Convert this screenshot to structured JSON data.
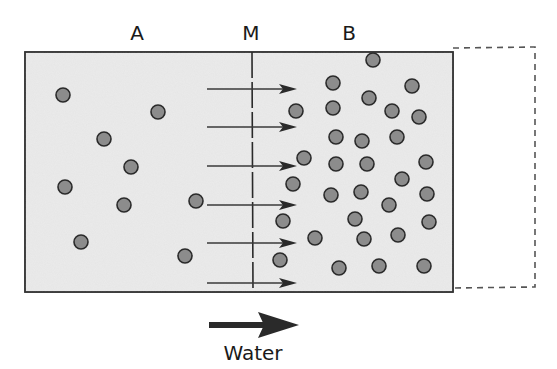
{
  "diagram": {
    "title_labels": {
      "compartment_a": "A",
      "membrane": "M",
      "compartment_b": "B"
    },
    "legend": {
      "label": "Water",
      "direction": "left-to-right"
    },
    "colors": {
      "solution_fill": "#ebebeb",
      "particle_fill": "#8c8c8c",
      "outline": "#2a2a2a",
      "dashed_outline": "#555555"
    },
    "compartment_a": {
      "particles": [
        [
          63,
          95
        ],
        [
          158,
          112
        ],
        [
          104,
          139
        ],
        [
          131,
          167
        ],
        [
          65,
          187
        ],
        [
          124,
          205
        ],
        [
          196,
          201
        ],
        [
          81,
          242
        ],
        [
          185,
          256
        ]
      ]
    },
    "compartment_b": {
      "particles": [
        [
          373,
          60
        ],
        [
          333,
          83
        ],
        [
          412,
          86
        ],
        [
          369,
          98
        ],
        [
          296,
          111
        ],
        [
          333,
          108
        ],
        [
          392,
          111
        ],
        [
          419,
          117
        ],
        [
          336,
          137
        ],
        [
          362,
          141
        ],
        [
          397,
          137
        ],
        [
          304,
          158
        ],
        [
          336,
          164
        ],
        [
          367,
          164
        ],
        [
          426,
          162
        ],
        [
          293,
          184
        ],
        [
          402,
          179
        ],
        [
          331,
          195
        ],
        [
          361,
          192
        ],
        [
          427,
          194
        ],
        [
          389,
          205
        ],
        [
          283,
          221
        ],
        [
          355,
          219
        ],
        [
          429,
          222
        ],
        [
          315,
          238
        ],
        [
          364,
          239
        ],
        [
          398,
          235
        ],
        [
          280,
          260
        ],
        [
          339,
          268
        ],
        [
          379,
          266
        ],
        [
          424,
          266
        ]
      ]
    },
    "flow_arrows_y": [
      89,
      127,
      166,
      205,
      243,
      283
    ],
    "counts": {
      "a_particles": 9,
      "b_particles": 31,
      "flow_arrows": 6
    }
  }
}
